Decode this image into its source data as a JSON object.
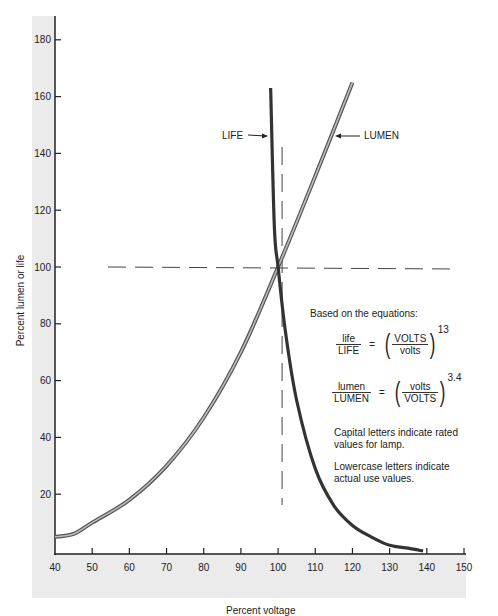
{
  "chart_data": {
    "type": "line",
    "title": "",
    "xlabel": "Percent voltage",
    "ylabel": "Percent lumen or life",
    "xlim": [
      40,
      150
    ],
    "ylim": [
      0,
      185
    ],
    "x_ticks": [
      40,
      50,
      60,
      70,
      80,
      90,
      100,
      110,
      120,
      130,
      140,
      150
    ],
    "y_ticks": [
      20,
      40,
      60,
      80,
      100,
      120,
      140,
      160,
      180
    ],
    "grid": false,
    "series": [
      {
        "name": "LIFE",
        "equation": "life/LIFE = (VOLTS/volts)^13",
        "x": [
          98,
          99,
          100,
          102,
          105,
          110,
          115,
          120,
          125,
          130,
          135,
          139
        ],
        "y": [
          163,
          114,
          100,
          77,
          53,
          29,
          16,
          9,
          5,
          2,
          1,
          0
        ]
      },
      {
        "name": "LUMEN",
        "equation": "lumen/LUMEN = (volts/VOLTS)^3.4",
        "x": [
          40,
          45,
          50,
          60,
          70,
          80,
          90,
          100,
          110,
          120
        ],
        "y": [
          5,
          6,
          10,
          18,
          30,
          47,
          70,
          100,
          132,
          165
        ]
      }
    ],
    "reference_lines": [
      {
        "orientation": "horizontal",
        "value": 100,
        "style": "dashed"
      },
      {
        "orientation": "vertical",
        "value": 100,
        "style": "dashed"
      }
    ],
    "annotations": [
      "LIFE",
      "LUMEN"
    ]
  },
  "labels": {
    "xlabel": "Percent voltage",
    "ylabel": "Percent lumen or life",
    "life_callout": "LIFE",
    "lumen_callout": "LUMEN"
  },
  "x_tick_labels": [
    "40",
    "50",
    "60",
    "70",
    "80",
    "90",
    "100",
    "110",
    "120",
    "130",
    "140",
    "150"
  ],
  "y_tick_labels": [
    "20",
    "40",
    "60",
    "80",
    "100",
    "120",
    "140",
    "160",
    "180"
  ],
  "notes": {
    "heading": "Based on the equations:",
    "eq1": {
      "num": "life",
      "den": "LIFE",
      "eq": "=",
      "inner_num": "VOLTS",
      "inner_den": "volts",
      "exp": "13"
    },
    "eq2": {
      "num": "lumen",
      "den": "LUMEN",
      "eq": "=",
      "inner_num": "volts",
      "inner_den": "VOLTS",
      "exp": "3.4"
    },
    "capital": "Capital letters indicate rated values for lamp.",
    "lowercase": "Lowercase letters indicate actual use values."
  },
  "colors": {
    "axis": "#222222",
    "band": "#ebebeb",
    "life_curve": "#333333",
    "lumen_curve_outer": "#555555",
    "lumen_curve_inner": "#bbbbbb",
    "dash": "#444444"
  }
}
